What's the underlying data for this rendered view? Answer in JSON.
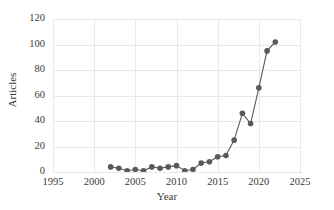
{
  "chart_data": {
    "type": "line",
    "title": "",
    "subtitle": "",
    "xlabel": "Year",
    "ylabel": "Articles",
    "xlim": [
      1995,
      2025
    ],
    "ylim": [
      0,
      120
    ],
    "xticks": [
      1995,
      2000,
      2005,
      2010,
      2015,
      2020,
      2025
    ],
    "yticks": [
      0,
      20,
      40,
      60,
      80,
      100,
      120
    ],
    "grid": true,
    "legend": false,
    "legend_position": "none",
    "marker": "circle",
    "marker_color": "#595959",
    "line_color": "#595959",
    "x": [
      2002,
      2003,
      2004,
      2005,
      2006,
      2007,
      2008,
      2009,
      2010,
      2011,
      2012,
      2013,
      2014,
      2015,
      2016,
      2017,
      2018,
      2019,
      2020,
      2021,
      2022
    ],
    "values": [
      4,
      3,
      1,
      2,
      1,
      4,
      3,
      4,
      5,
      1,
      2,
      7,
      8,
      12,
      13,
      25,
      46,
      38,
      66,
      95,
      102
    ],
    "series": [
      {
        "name": "Articles",
        "values": [
          4,
          3,
          1,
          2,
          1,
          4,
          3,
          4,
          5,
          1,
          2,
          7,
          8,
          12,
          13,
          25,
          46,
          38,
          66,
          95,
          102
        ]
      }
    ]
  },
  "axes": {
    "y_tick_labels": [
      "0",
      "20",
      "40",
      "60",
      "80",
      "100",
      "120"
    ],
    "x_tick_labels": [
      "1995",
      "2000",
      "2005",
      "2010",
      "2015",
      "2020",
      "2025"
    ],
    "x_axis_title": "Year",
    "y_axis_title": "Articles"
  },
  "colors": {
    "marker": "#595959",
    "line": "#595959",
    "grid": "#e9e9e9",
    "axis": "#b0b0b0",
    "text": "#3a3a3a",
    "background": "#ffffff"
  }
}
